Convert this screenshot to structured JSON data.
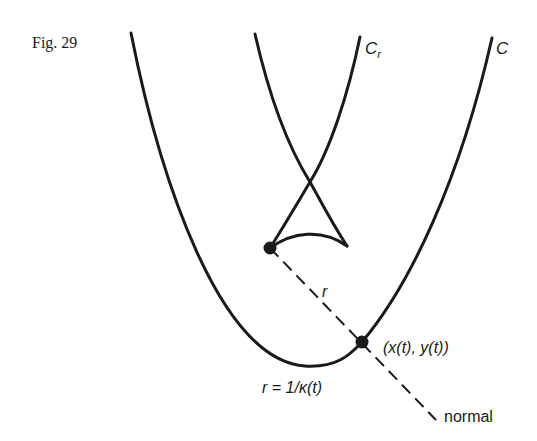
{
  "figure": {
    "caption": "Fig. 29",
    "labels": {
      "curve_c": "C",
      "curve_cr_main": "C",
      "curve_cr_sub": "r",
      "radius": "r",
      "point": "(x(t), y(t))",
      "radius_formula": "r = 1/κ(t)",
      "normal": "normal"
    },
    "colors": {
      "ink": "#1a1a1a",
      "background": "#ffffff"
    }
  }
}
